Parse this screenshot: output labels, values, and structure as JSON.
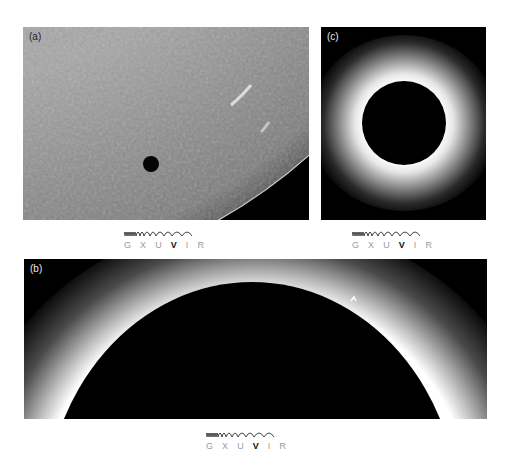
{
  "panels": [
    {
      "id": "a",
      "label": "(a)",
      "subject": "solar disc with planetary transit",
      "legend": {
        "bands": [
          "G",
          "X",
          "U",
          "V",
          "I",
          "R"
        ],
        "active_band": "V"
      }
    },
    {
      "id": "b",
      "label": "(b)",
      "subject": "solar eclipse with chromosphere and prominences",
      "legend": {
        "bands": [
          "G",
          "X",
          "U",
          "V",
          "I",
          "R"
        ],
        "active_band": "V"
      }
    },
    {
      "id": "c",
      "label": "(c)",
      "subject": "total solar eclipse corona",
      "legend": {
        "bands": [
          "G",
          "X",
          "U",
          "V",
          "I",
          "R"
        ],
        "active_band": "V"
      }
    }
  ],
  "colors": {
    "background": "#ffffff",
    "sky": "#000000",
    "photosphere": "#8c8c8c",
    "legend_inactive": "#9a9a9a",
    "legend_active": "#111111"
  }
}
